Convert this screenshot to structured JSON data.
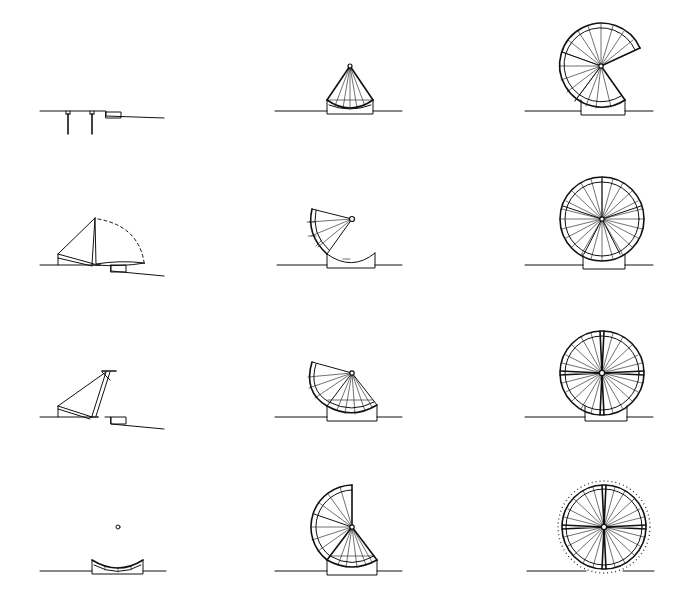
{
  "figure": {
    "type": "sequence-diagram",
    "grid": {
      "rows": 4,
      "columns": 3
    },
    "stroke_color": "#111111",
    "background_color": "#ffffff",
    "description": "Twelve-stage line drawing of a radial-spoked wheel structure unfolding from a cradle base"
  },
  "panels": [
    {
      "id": "r1c1",
      "row": 1,
      "col": 1,
      "label": "stage-1-foundation-piles",
      "ground_y": 111
    },
    {
      "id": "r1c2",
      "row": 1,
      "col": 2,
      "label": "stage-5-segment-on-cradle",
      "ground_y": 111,
      "hub": [
        350,
        66
      ]
    },
    {
      "id": "r1c3",
      "row": 1,
      "col": 3,
      "label": "stage-9-wheel-partially-open",
      "ground_y": 111,
      "hub": [
        601,
        66
      ],
      "radius": 42
    },
    {
      "id": "r2c1",
      "row": 2,
      "col": 1,
      "label": "stage-2-segment-lifting-arc",
      "ground_y": 265
    },
    {
      "id": "r2c2",
      "row": 2,
      "col": 2,
      "label": "stage-6-segment-rotating-on-cradle",
      "ground_y": 265,
      "hub": [
        352,
        219
      ]
    },
    {
      "id": "r2c3",
      "row": 2,
      "col": 3,
      "label": "stage-10-wheel-complete",
      "ground_y": 265,
      "hub": [
        602,
        219
      ],
      "radius": 42
    },
    {
      "id": "r3c1",
      "row": 3,
      "col": 1,
      "label": "stage-3-segment-upright",
      "ground_y": 417
    },
    {
      "id": "r3c2",
      "row": 3,
      "col": 2,
      "label": "stage-7-quarter-fan",
      "ground_y": 417,
      "hub": [
        352,
        373
      ]
    },
    {
      "id": "r3c3",
      "row": 3,
      "col": 3,
      "label": "stage-11-wheel-braced-cross",
      "ground_y": 417,
      "hub": [
        602,
        373
      ],
      "radius": 42
    },
    {
      "id": "r4c1",
      "row": 4,
      "col": 1,
      "label": "stage-4-cradle-placed",
      "ground_y": 571
    },
    {
      "id": "r4c2",
      "row": 4,
      "col": 2,
      "label": "stage-8-half-wheel",
      "ground_y": 571,
      "hub": [
        352,
        527
      ]
    },
    {
      "id": "r4c3",
      "row": 4,
      "col": 3,
      "label": "stage-12-wheel-with-ring-teeth",
      "ground_y": 571,
      "hub": [
        604,
        527
      ],
      "radius": 42
    }
  ]
}
